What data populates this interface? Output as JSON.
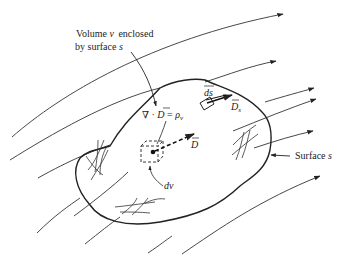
{
  "figure": {
    "labels": {
      "volume_line1": "Volume",
      "volume_symbol": "v",
      "volume_line1_rest": "enclosed",
      "volume_line2": "by surface",
      "volume_line2_symbol": "s",
      "equation_nabla": "∇ · ",
      "equation_D": "D",
      "equation_eq": " = ",
      "equation_rho": "ρ",
      "equation_rho_sub": "v",
      "ds": "ds",
      "Ds": "D",
      "Ds_sub": "s",
      "D": "D",
      "dv": "dv",
      "surface_label": "Surface",
      "surface_symbol": "s"
    },
    "colors": {
      "ink": "#222222",
      "background": "#ffffff"
    }
  }
}
